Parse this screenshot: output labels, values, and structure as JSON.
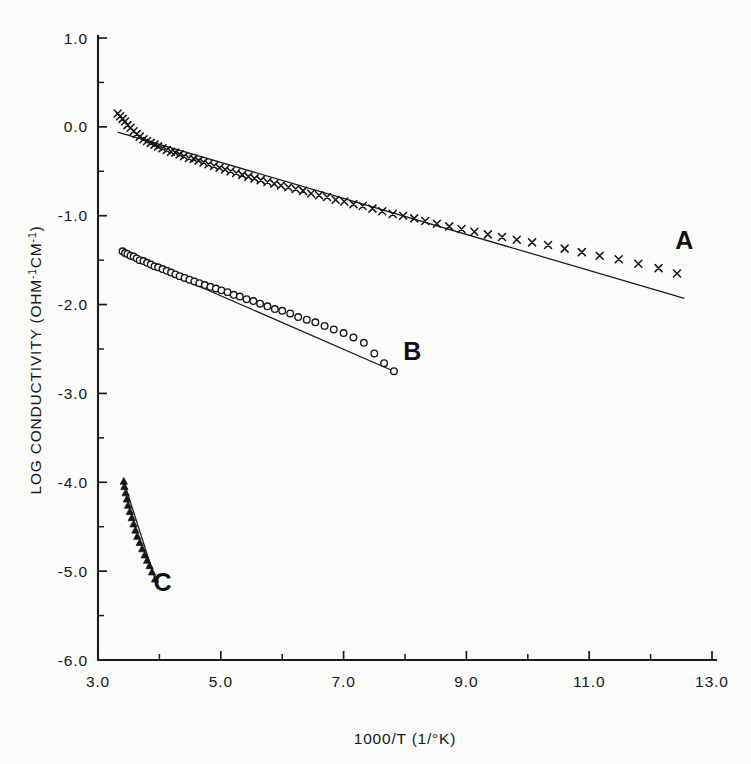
{
  "chart_data": {
    "type": "scatter",
    "title": "",
    "xlabel": "1000/T (1/°K)",
    "ylabel": "LOG CONDUCTIVITY (OHM⁻¹CM⁻¹)",
    "xlim": [
      3.0,
      13.0
    ],
    "ylim": [
      -6.0,
      1.0
    ],
    "grid": false,
    "legend_position": "inline-labels",
    "xticks": [
      3.0,
      4.0,
      5.0,
      6.0,
      7.0,
      8.0,
      9.0,
      10.0,
      11.0,
      12.0,
      13.0
    ],
    "xtick_labels": [
      "3.0",
      "",
      "5.0",
      "",
      "7.0",
      "",
      "9.0",
      "",
      "11.0",
      "",
      "13.0"
    ],
    "yticks": [
      1.0,
      0.0,
      -1.0,
      -2.0,
      -3.0,
      -4.0,
      -5.0,
      -6.0
    ],
    "ytick_labels": [
      "1.0",
      "0.0",
      "-1.0",
      "-2.0",
      "-3.0",
      "-4.0",
      "-5.0",
      "-6.0"
    ],
    "series": [
      {
        "name": "A",
        "label": "A",
        "marker": "cross",
        "label_x": 12.55,
        "label_y": -1.37,
        "fit_line": {
          "x": [
            3.32,
            12.55
          ],
          "y": [
            -0.06,
            -1.93
          ]
        },
        "points": [
          [
            3.32,
            0.15
          ],
          [
            3.36,
            0.12
          ],
          [
            3.4,
            0.09
          ],
          [
            3.44,
            0.06
          ],
          [
            3.48,
            0.02
          ],
          [
            3.53,
            -0.01
          ],
          [
            3.58,
            -0.05
          ],
          [
            3.63,
            -0.08
          ],
          [
            3.68,
            -0.11
          ],
          [
            3.74,
            -0.14
          ],
          [
            3.8,
            -0.16
          ],
          [
            3.86,
            -0.18
          ],
          [
            3.92,
            -0.2
          ],
          [
            3.98,
            -0.22
          ],
          [
            4.05,
            -0.24
          ],
          [
            4.12,
            -0.26
          ],
          [
            4.19,
            -0.28
          ],
          [
            4.26,
            -0.29
          ],
          [
            4.33,
            -0.31
          ],
          [
            4.4,
            -0.33
          ],
          [
            4.48,
            -0.35
          ],
          [
            4.56,
            -0.36
          ],
          [
            4.64,
            -0.38
          ],
          [
            4.72,
            -0.4
          ],
          [
            4.8,
            -0.42
          ],
          [
            4.89,
            -0.44
          ],
          [
            4.98,
            -0.46
          ],
          [
            5.07,
            -0.48
          ],
          [
            5.16,
            -0.5
          ],
          [
            5.25,
            -0.52
          ],
          [
            5.35,
            -0.54
          ],
          [
            5.45,
            -0.56
          ],
          [
            5.55,
            -0.58
          ],
          [
            5.65,
            -0.6
          ],
          [
            5.76,
            -0.62
          ],
          [
            5.87,
            -0.64
          ],
          [
            5.98,
            -0.66
          ],
          [
            6.1,
            -0.68
          ],
          [
            6.22,
            -0.7
          ],
          [
            6.34,
            -0.72
          ],
          [
            6.47,
            -0.75
          ],
          [
            6.6,
            -0.77
          ],
          [
            6.73,
            -0.79
          ],
          [
            6.87,
            -0.82
          ],
          [
            7.01,
            -0.84
          ],
          [
            7.16,
            -0.87
          ],
          [
            7.31,
            -0.89
          ],
          [
            7.47,
            -0.92
          ],
          [
            7.63,
            -0.95
          ],
          [
            7.8,
            -0.98
          ],
          [
            7.97,
            -1.0
          ],
          [
            8.15,
            -1.03
          ],
          [
            8.33,
            -1.06
          ],
          [
            8.52,
            -1.09
          ],
          [
            8.72,
            -1.12
          ],
          [
            8.92,
            -1.15
          ],
          [
            9.13,
            -1.18
          ],
          [
            9.35,
            -1.21
          ],
          [
            9.58,
            -1.24
          ],
          [
            9.82,
            -1.27
          ],
          [
            10.07,
            -1.3
          ],
          [
            10.33,
            -1.33
          ],
          [
            10.6,
            -1.37
          ],
          [
            10.88,
            -1.41
          ],
          [
            11.17,
            -1.45
          ],
          [
            11.48,
            -1.49
          ],
          [
            11.8,
            -1.54
          ],
          [
            12.13,
            -1.59
          ],
          [
            12.43,
            -1.65
          ]
        ]
      },
      {
        "name": "B",
        "label": "B",
        "marker": "circle",
        "label_x": 8.12,
        "label_y": -2.62,
        "fit_line": {
          "x": [
            3.4,
            7.82
          ],
          "y": [
            -1.42,
            -2.75
          ]
        },
        "points": [
          [
            3.4,
            -1.4
          ],
          [
            3.44,
            -1.42
          ],
          [
            3.48,
            -1.43
          ],
          [
            3.53,
            -1.45
          ],
          [
            3.58,
            -1.46
          ],
          [
            3.63,
            -1.48
          ],
          [
            3.68,
            -1.5
          ],
          [
            3.74,
            -1.51
          ],
          [
            3.8,
            -1.53
          ],
          [
            3.86,
            -1.55
          ],
          [
            3.92,
            -1.57
          ],
          [
            3.98,
            -1.58
          ],
          [
            4.05,
            -1.6
          ],
          [
            4.12,
            -1.62
          ],
          [
            4.19,
            -1.64
          ],
          [
            4.26,
            -1.66
          ],
          [
            4.33,
            -1.68
          ],
          [
            4.41,
            -1.7
          ],
          [
            4.49,
            -1.72
          ],
          [
            4.57,
            -1.74
          ],
          [
            4.65,
            -1.76
          ],
          [
            4.74,
            -1.78
          ],
          [
            4.83,
            -1.8
          ],
          [
            4.92,
            -1.82
          ],
          [
            5.01,
            -1.84
          ],
          [
            5.11,
            -1.86
          ],
          [
            5.21,
            -1.89
          ],
          [
            5.31,
            -1.91
          ],
          [
            5.42,
            -1.94
          ],
          [
            5.53,
            -1.96
          ],
          [
            5.64,
            -1.99
          ],
          [
            5.76,
            -2.02
          ],
          [
            5.88,
            -2.05
          ],
          [
            6.0,
            -2.07
          ],
          [
            6.13,
            -2.1
          ],
          [
            6.26,
            -2.14
          ],
          [
            6.4,
            -2.17
          ],
          [
            6.54,
            -2.2
          ],
          [
            6.69,
            -2.24
          ],
          [
            6.84,
            -2.28
          ],
          [
            7.0,
            -2.32
          ],
          [
            7.16,
            -2.37
          ],
          [
            7.33,
            -2.43
          ],
          [
            7.5,
            -2.55
          ],
          [
            7.66,
            -2.66
          ],
          [
            7.82,
            -2.75
          ]
        ]
      },
      {
        "name": "C",
        "label": "C",
        "marker": "triangle",
        "label_x": 4.05,
        "label_y": -5.22,
        "fit_line": {
          "x": [
            3.42,
            3.93
          ],
          "y": [
            -3.99,
            -5.09
          ]
        },
        "points": [
          [
            3.42,
            -3.99
          ],
          [
            3.43,
            -4.05
          ],
          [
            3.45,
            -4.12
          ],
          [
            3.47,
            -4.19
          ],
          [
            3.49,
            -4.26
          ],
          [
            3.52,
            -4.33
          ],
          [
            3.55,
            -4.4
          ],
          [
            3.58,
            -4.47
          ],
          [
            3.61,
            -4.54
          ],
          [
            3.64,
            -4.61
          ],
          [
            3.68,
            -4.68
          ],
          [
            3.72,
            -4.75
          ],
          [
            3.76,
            -4.82
          ],
          [
            3.8,
            -4.88
          ],
          [
            3.84,
            -4.94
          ],
          [
            3.88,
            -5.01
          ],
          [
            3.93,
            -5.09
          ]
        ]
      }
    ]
  },
  "axis": {
    "ylabel_main": "LOG CONDUCTIVITY  (OHM",
    "ylabel_sup1": "-1",
    "ylabel_mid": "CM",
    "ylabel_sup2": "-1",
    "ylabel_end": ")",
    "xlabel_text": "1000/T (1/°K)"
  },
  "colors": {
    "background": "#fbfbf9",
    "ink": "#1a1a1a",
    "marker": "#151515"
  }
}
